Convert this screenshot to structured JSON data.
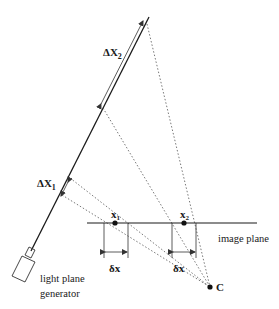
{
  "diagram": {
    "labels": {
      "delta_X2": "ΔX",
      "delta_X2_sub": "2",
      "delta_X1": "ΔX",
      "delta_X1_sub": "1",
      "x1": "x",
      "x1_sub": "1",
      "x2": "x",
      "x2_sub": "2",
      "delta_x_1": "δx",
      "delta_x_2": "δx",
      "image_plane": "image plane",
      "camera_center": "C",
      "generator_line1": "light plane",
      "generator_line2": "generator"
    },
    "colors": {
      "line": "#1a1a1a",
      "dotted": "#555555",
      "background": "#ffffff"
    }
  }
}
